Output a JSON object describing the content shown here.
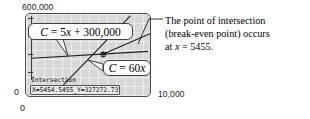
{
  "figure": {
    "axes": {
      "y_max_label": "600,000",
      "y_min_label": "0",
      "x_min_label": "0",
      "x_max_label": "10,000"
    },
    "callouts": {
      "cost_line": "C = 5x + 300,000",
      "revenue_line": "C = 60x"
    },
    "calculator_readout": {
      "title": "Intersection",
      "values": "X=5454.5455_Y=327272.73"
    },
    "annotation": {
      "line1": "The point of intersection",
      "line2": "(break-even point) occurs",
      "line3_prefix": "at ",
      "line3_var": "x",
      "line3_suffix": " = 5455."
    },
    "colors": {
      "screen_background": "#d8d8d8",
      "screen_border": "#4a4a4a",
      "line_stroke": "#1a1a1a",
      "callout_border": "#3d3d3d",
      "text": "#000000"
    }
  },
  "chart_data": {
    "type": "line",
    "title": "",
    "xlabel": "",
    "ylabel": "",
    "xlim": [
      0,
      10000
    ],
    "ylim": [
      0,
      600000
    ],
    "grid": true,
    "legend": "callouts",
    "series": [
      {
        "name": "C = 5x + 300,000",
        "equation": "C = 5x + 300000",
        "slope": 5,
        "intercept": 300000,
        "x": [
          0,
          10000
        ],
        "values": [
          300000,
          350000
        ]
      },
      {
        "name": "C = 60x",
        "equation": "C = 60x",
        "slope": 60,
        "intercept": 0,
        "x": [
          0,
          10000
        ],
        "values": [
          0,
          600000
        ]
      }
    ],
    "annotations": [
      {
        "label": "Intersection",
        "x": 5454.5455,
        "y": 327272.73,
        "note": "break-even point occurs at x = 5455"
      }
    ]
  }
}
